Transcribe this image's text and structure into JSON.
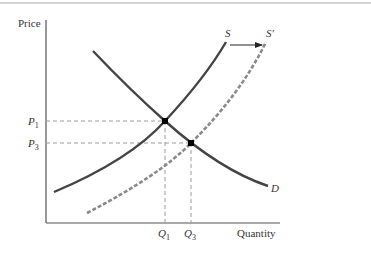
{
  "diagram": {
    "axes": {
      "y_label": "Price",
      "x_label": "Quantity"
    },
    "curves": {
      "demand": {
        "label": "D",
        "style": "solid",
        "color": "#444444"
      },
      "supply": {
        "label": "S",
        "style": "solid",
        "color": "#444444"
      },
      "supply_shifted": {
        "label": "S′",
        "style": "dashed",
        "color": "#8a8a8a"
      }
    },
    "price_levels": [
      {
        "label": "P",
        "subscript": "1"
      },
      {
        "label": "P",
        "subscript": "3"
      }
    ],
    "quantity_levels": [
      {
        "label": "Q",
        "subscript": "1"
      },
      {
        "label": "Q",
        "subscript": "3"
      }
    ],
    "shift_arrow": {
      "from": "S",
      "to": "S′",
      "direction": "right"
    },
    "equilibria": [
      {
        "name": "initial",
        "price": "P1",
        "quantity": "Q1"
      },
      {
        "name": "new",
        "price": "P3",
        "quantity": "Q3"
      }
    ]
  },
  "colors": {
    "axis": "#555555",
    "curve": "#444444",
    "dashed_curve": "#8a8a8a",
    "guide": "#9a9a9a",
    "point": "#000000",
    "top_rule": "#d4d4d4"
  }
}
